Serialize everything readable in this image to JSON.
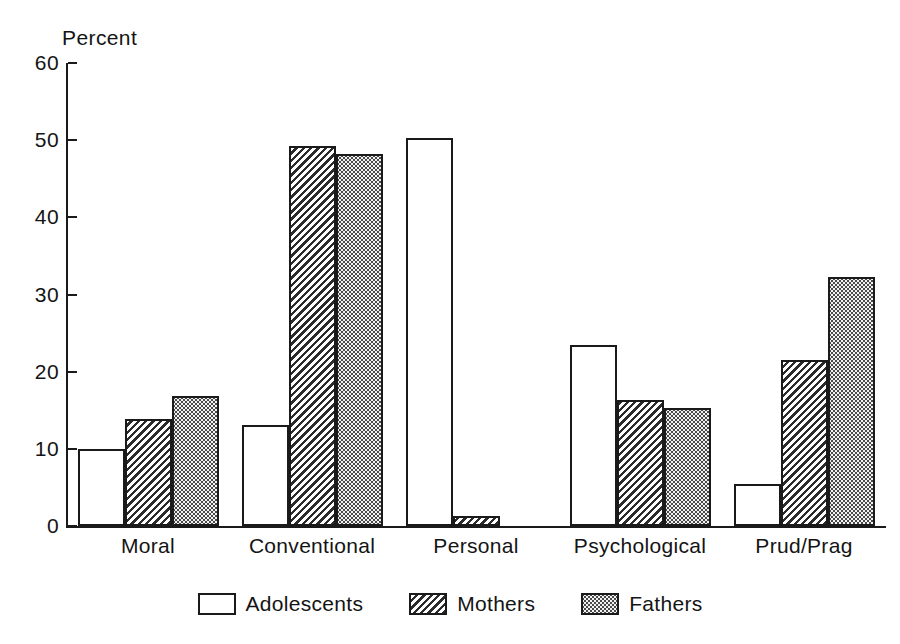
{
  "chart_data": {
    "type": "bar",
    "title": "",
    "subtitle": "",
    "xlabel": "",
    "ylabel": "Percent",
    "ylim": [
      0,
      60
    ],
    "yticks": [
      0,
      10,
      20,
      30,
      40,
      50,
      60
    ],
    "ytick_labels": [
      "0",
      "10",
      "20",
      "30",
      "40",
      "50",
      "60"
    ],
    "grid": false,
    "legend_position": "bottom",
    "categories": [
      "Moral",
      "Conventional",
      "Personal",
      "Psychological",
      "Prud/Prag"
    ],
    "series": [
      {
        "name": "Adolescents",
        "fill": "open",
        "values": [
          10.0,
          13.1,
          50.3,
          23.4,
          5.5
        ]
      },
      {
        "name": "Mothers",
        "fill": "hatch",
        "values": [
          13.9,
          49.2,
          1.3,
          16.3,
          21.5
        ]
      },
      {
        "name": "Fathers",
        "fill": "dots",
        "values": [
          16.9,
          48.2,
          0.0,
          15.3,
          32.3
        ]
      }
    ],
    "colors": {
      "axis": "#1a1a1a",
      "text": "#141414",
      "bar_outline": "#1a1a1a",
      "adolescents_fill": "#ffffff",
      "mothers_fill": "#2b2b2b",
      "fathers_fill": "#f2f2f2",
      "background": "#ffffff"
    }
  }
}
